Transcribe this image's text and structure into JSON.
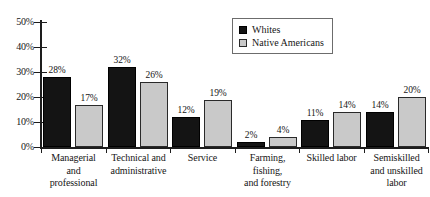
{
  "chart_data": {
    "type": "bar",
    "title": "",
    "xlabel": "",
    "ylabel": "",
    "ylim": [
      0,
      50
    ],
    "ytick_labels": [
      "0%",
      "10%",
      "20%",
      "30%",
      "40%",
      "50%"
    ],
    "ytick_values": [
      0,
      10,
      20,
      30,
      40,
      50
    ],
    "grid": false,
    "legend_position": "top-right",
    "categories": [
      "Managerial\nand\nprofessional",
      "Technical and\nadministrative",
      "Service",
      "Farming,\nfishing,\nand forestry",
      "Skilled labor",
      "Semiskilled\nand unskilled\nlabor"
    ],
    "series": [
      {
        "name": "Whites",
        "color": "#141414",
        "values": [
          28,
          32,
          12,
          2,
          11,
          14
        ],
        "value_labels": [
          "28%",
          "32%",
          "12%",
          "2%",
          "11%",
          "14%"
        ]
      },
      {
        "name": "Native Americans",
        "color": "#c9c9c9",
        "values": [
          17,
          26,
          19,
          4,
          14,
          20
        ],
        "value_labels": [
          "17%",
          "26%",
          "19%",
          "4%",
          "14%",
          "20%"
        ]
      }
    ]
  },
  "legend": {
    "items": [
      {
        "label": "Whites",
        "swatch": "black-square-swatch"
      },
      {
        "label": "Native Americans",
        "swatch": "gray-square-swatch"
      }
    ]
  }
}
